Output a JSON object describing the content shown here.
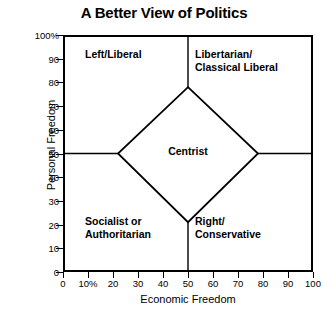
{
  "chart_data": {
    "type": "scatter",
    "title": "A Better View of Politics",
    "xlabel": "Economic Freedom",
    "ylabel": "Personal Freedom",
    "xlim": [
      0,
      100
    ],
    "ylim": [
      0,
      100
    ],
    "grid": false,
    "legend": "none",
    "x_ticks": [
      "0",
      "10%",
      "20",
      "30",
      "40",
      "50",
      "60",
      "70",
      "80",
      "90",
      "100"
    ],
    "x_tick_values": [
      0,
      10,
      20,
      30,
      40,
      50,
      60,
      70,
      80,
      90,
      100
    ],
    "y_ticks": [
      "0",
      "10",
      "20",
      "30",
      "40",
      "50",
      "60",
      "70",
      "80",
      "90",
      "100%"
    ],
    "y_tick_values": [
      0,
      10,
      20,
      30,
      40,
      50,
      60,
      70,
      80,
      90,
      100
    ],
    "regions": [
      {
        "name": "top-left",
        "label": "Left/Liberal",
        "x_range": [
          0,
          50
        ],
        "y_range": [
          50,
          100
        ]
      },
      {
        "name": "top-right",
        "label": "Libertarian/\nClassical Liberal",
        "x_range": [
          50,
          100
        ],
        "y_range": [
          50,
          100
        ]
      },
      {
        "name": "bottom-left",
        "label": "Socialist or\nAuthoritarian",
        "x_range": [
          0,
          50
        ],
        "y_range": [
          0,
          50
        ]
      },
      {
        "name": "bottom-right",
        "label": "Right/\nConservative",
        "x_range": [
          50,
          100
        ],
        "y_range": [
          0,
          50
        ]
      },
      {
        "name": "center",
        "label": "Centrist",
        "shape": "diamond",
        "vertices": [
          [
            50,
            78
          ],
          [
            78,
            50
          ],
          [
            50,
            21
          ],
          [
            22,
            50
          ]
        ]
      }
    ],
    "divider_lines": [
      {
        "orientation": "vertical",
        "value": 50
      },
      {
        "orientation": "horizontal",
        "value": 50
      }
    ],
    "line_color": "#000000",
    "background_color": "#ffffff"
  },
  "labels": {
    "title": "A Better View of Politics",
    "ylabel": "Personal Freedom",
    "xlabel": "Economic Freedom",
    "quadrant_top_left": "Left/Liberal",
    "quadrant_top_right": "Libertarian/\nClassical Liberal",
    "quadrant_bottom_left": "Socialist or\nAuthoritarian",
    "quadrant_bottom_right": "Right/\nConservative",
    "center": "Centrist"
  }
}
